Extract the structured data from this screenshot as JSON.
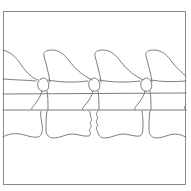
{
  "diagram": {
    "type": "line-drawing",
    "colors": {
      "background": "#ffffff",
      "stroke": "#6e6e6e",
      "frame": "#8a8a8a"
    },
    "frame": {
      "x": 3,
      "y": 11,
      "width": 183,
      "height": 174
    },
    "vertebra_count": 3,
    "vertebrae": [
      {
        "id": "left",
        "joint_x": 42
      },
      {
        "id": "middle",
        "joint_x": 93,
        "irregular_endplate": true
      },
      {
        "id": "right",
        "joint_x": 145
      }
    ]
  }
}
